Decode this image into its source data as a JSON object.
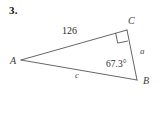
{
  "figure": {
    "problem_number": "3.",
    "type": "right-triangle-diagram",
    "stroke_color": "#555555",
    "background_color": "#ffffff",
    "vertices": [
      {
        "name": "A",
        "label": "A"
      },
      {
        "name": "B",
        "label": "B"
      },
      {
        "name": "C",
        "label": "C"
      }
    ],
    "sides": [
      {
        "name": "side-AC",
        "label": "126",
        "style": "numeric"
      },
      {
        "name": "side-AB",
        "label": "c",
        "style": "italic-variable"
      },
      {
        "name": "side-CB",
        "label": "a",
        "style": "italic-variable"
      }
    ],
    "angles": [
      {
        "name": "angle-B",
        "label": "67.3°",
        "at_vertex": "B"
      },
      {
        "name": "angle-C",
        "label": "",
        "at_vertex": "C",
        "marker": "right-angle-square"
      }
    ]
  }
}
